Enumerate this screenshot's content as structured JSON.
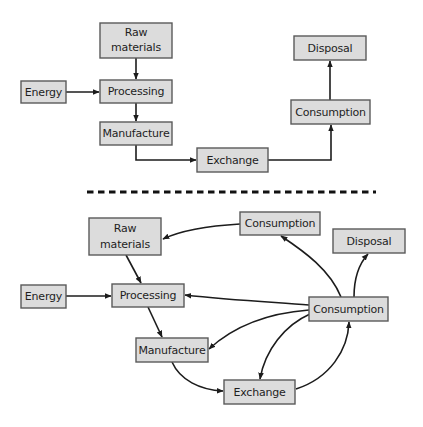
{
  "diagram": {
    "colors": {
      "box_fill": "#dcdcdc",
      "box_stroke": "#5a5a5a",
      "text": "#1e1e1e",
      "arrow": "#1c1c1c",
      "divider": "#111111"
    },
    "linear": {
      "nodes": {
        "raw_materials": {
          "line1": "Raw",
          "line2": "materials"
        },
        "energy": {
          "label": "Energy"
        },
        "processing": {
          "label": "Processing"
        },
        "manufacture": {
          "label": "Manufacture"
        },
        "exchange": {
          "label": "Exchange"
        },
        "consumption": {
          "label": "Consumption"
        },
        "disposal": {
          "label": "Disposal"
        }
      },
      "edges": [
        {
          "from": "Raw materials",
          "to": "Processing"
        },
        {
          "from": "Energy",
          "to": "Processing"
        },
        {
          "from": "Processing",
          "to": "Manufacture"
        },
        {
          "from": "Manufacture",
          "to": "Exchange"
        },
        {
          "from": "Exchange",
          "to": "Consumption"
        },
        {
          "from": "Consumption",
          "to": "Disposal"
        }
      ]
    },
    "circular": {
      "nodes": {
        "raw_materials": {
          "line1": "Raw",
          "line2": "materials"
        },
        "consumption_top": {
          "label": "Consumption"
        },
        "disposal": {
          "label": "Disposal"
        },
        "energy": {
          "label": "Energy"
        },
        "processing": {
          "label": "Processing"
        },
        "consumption_hub": {
          "label": "Consumption"
        },
        "manufacture": {
          "label": "Manufacture"
        },
        "exchange": {
          "label": "Exchange"
        }
      },
      "edges": [
        {
          "from": "Consumption (top)",
          "to": "Raw materials"
        },
        {
          "from": "Raw materials",
          "to": "Processing"
        },
        {
          "from": "Energy",
          "to": "Processing"
        },
        {
          "from": "Processing",
          "to": "Manufacture"
        },
        {
          "from": "Manufacture",
          "to": "Exchange"
        },
        {
          "from": "Exchange",
          "to": "Consumption (hub)"
        },
        {
          "from": "Consumption (hub)",
          "to": "Consumption (top)"
        },
        {
          "from": "Consumption (hub)",
          "to": "Disposal"
        },
        {
          "from": "Consumption (hub)",
          "to": "Processing"
        },
        {
          "from": "Consumption (hub)",
          "to": "Manufacture"
        },
        {
          "from": "Consumption (hub)",
          "to": "Exchange"
        }
      ]
    }
  }
}
